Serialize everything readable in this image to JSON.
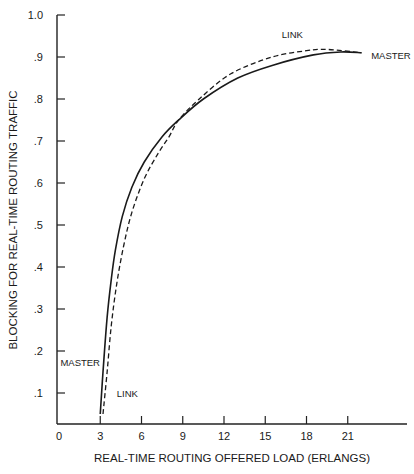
{
  "chart_data": {
    "type": "line",
    "title": "",
    "xlabel": "REAL-TIME ROUTING OFFERED LOAD (ERLANGS)",
    "ylabel": "BLOCKING FOR REAL-TIME ROUTING TRAFFIC",
    "xlim": [
      0,
      25
    ],
    "ylim": [
      0.03,
      1.0
    ],
    "x_ticks": [
      0,
      3,
      6,
      9,
      12,
      15,
      18,
      21
    ],
    "x_tick_labels": [
      "0",
      "3",
      "6",
      "9",
      "12",
      "15",
      "18",
      "21"
    ],
    "y_ticks": [
      0.1,
      0.2,
      0.3,
      0.4,
      0.5,
      0.6,
      0.7,
      0.8,
      0.9,
      1.0
    ],
    "y_tick_labels": [
      ".1",
      ".2",
      ".3",
      ".4",
      ".5",
      ".6",
      ".7",
      ".8",
      ".9",
      "1.0"
    ],
    "grid": false,
    "legend": "inline labels",
    "series": [
      {
        "name": "MASTER",
        "style": "solid",
        "x": [
          3.0,
          3.2,
          3.5,
          3.8,
          4.1,
          4.6,
          5.3,
          6.2,
          7.5,
          8.7,
          10.5,
          13.0,
          15.5,
          18.5,
          20.5,
          22.0
        ],
        "y": [
          0.05,
          0.15,
          0.28,
          0.37,
          0.44,
          0.52,
          0.59,
          0.65,
          0.71,
          0.75,
          0.8,
          0.85,
          0.88,
          0.905,
          0.912,
          0.91
        ]
      },
      {
        "name": "LINK",
        "style": "dashed",
        "x": [
          3.2,
          3.5,
          3.8,
          4.2,
          4.7,
          5.3,
          6.2,
          7.2,
          8.0,
          8.7,
          10.2,
          12.5,
          15.5,
          18.0,
          19.5,
          22.0
        ],
        "y": [
          0.05,
          0.15,
          0.26,
          0.36,
          0.45,
          0.53,
          0.61,
          0.67,
          0.71,
          0.75,
          0.8,
          0.86,
          0.9,
          0.915,
          0.918,
          0.91
        ]
      }
    ],
    "annotations": [
      {
        "text": "LINK",
        "x": 16.2,
        "y": 0.945
      },
      {
        "text": "MASTER",
        "x": 22.7,
        "y": 0.895
      },
      {
        "text": "MASTER",
        "x": 0.1,
        "y": 0.165
      },
      {
        "text": "LINK",
        "x": 4.2,
        "y": 0.09
      }
    ]
  }
}
